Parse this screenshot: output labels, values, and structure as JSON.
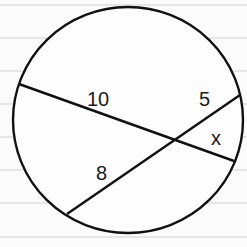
{
  "diagram": {
    "labels": {
      "segment_a": "10",
      "segment_b": "5",
      "segment_c": "8",
      "segment_d": "x"
    },
    "colors": {
      "stroke": "#111111",
      "ruled_line": "#cfcfcf",
      "background": "#fbfbfb"
    }
  }
}
